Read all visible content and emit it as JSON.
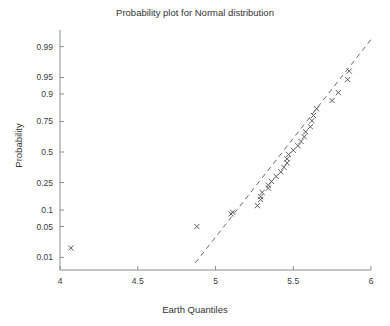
{
  "chart_data": {
    "type": "scatter",
    "title": "Probability plot for Normal distribution",
    "xlabel": "Earth Quantiles",
    "ylabel": "Probability",
    "xlim": [
      4,
      6
    ],
    "ylim": [
      0.0046,
      0.9954
    ],
    "yscale": "normal-probability",
    "grid": false,
    "legend": null,
    "xticks": [
      "4",
      "4.5",
      "5",
      "5.5",
      "6"
    ],
    "xtick_values": [
      4,
      4.5,
      5,
      5.5,
      6
    ],
    "yticks": [
      "0.01",
      "0.05",
      "0.1",
      "0.25",
      "0.5",
      "0.75",
      "0.9",
      "0.95",
      "0.99"
    ],
    "ytick_values": [
      0.01,
      0.05,
      0.1,
      0.25,
      0.5,
      0.75,
      0.9,
      0.95,
      0.99
    ],
    "marker": "x",
    "marker_color": "#4a4a4a",
    "line_style": "dashed",
    "line_color": "#6a6a6a",
    "reference_line": {
      "x": [
        4.87,
        6.0
      ],
      "y": [
        0.0072,
        0.9935
      ]
    },
    "series": [
      {
        "name": "Earth Quantiles",
        "x": [
          4.07,
          4.88,
          5.1,
          5.11,
          5.27,
          5.29,
          5.29,
          5.3,
          5.34,
          5.34,
          5.36,
          5.39,
          5.42,
          5.44,
          5.46,
          5.46,
          5.47,
          5.5,
          5.53,
          5.55,
          5.57,
          5.58,
          5.61,
          5.62,
          5.63,
          5.65,
          5.75,
          5.79,
          5.85,
          5.86
        ],
        "y": [
          0.017,
          0.05,
          0.086,
          0.092,
          0.118,
          0.147,
          0.162,
          0.186,
          0.213,
          0.232,
          0.258,
          0.295,
          0.33,
          0.368,
          0.405,
          0.44,
          0.478,
          0.515,
          0.555,
          0.592,
          0.632,
          0.672,
          0.712,
          0.755,
          0.79,
          0.83,
          0.872,
          0.905,
          0.945,
          0.963
        ]
      }
    ]
  },
  "axes": {
    "plot_left": 60,
    "plot_right": 371,
    "plot_top": 34,
    "plot_bottom": 270
  }
}
